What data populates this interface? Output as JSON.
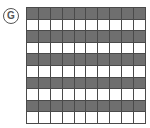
{
  "label": "G",
  "grid": {
    "rows": 10,
    "cols": 10,
    "shaded_rows": [
      0,
      2,
      4,
      6,
      8
    ],
    "shaded_count": 50,
    "total_count": 100,
    "colors": {
      "shaded": "#6f6f6f",
      "unshaded": "#ffffff",
      "line": "#4a4a4a"
    }
  }
}
